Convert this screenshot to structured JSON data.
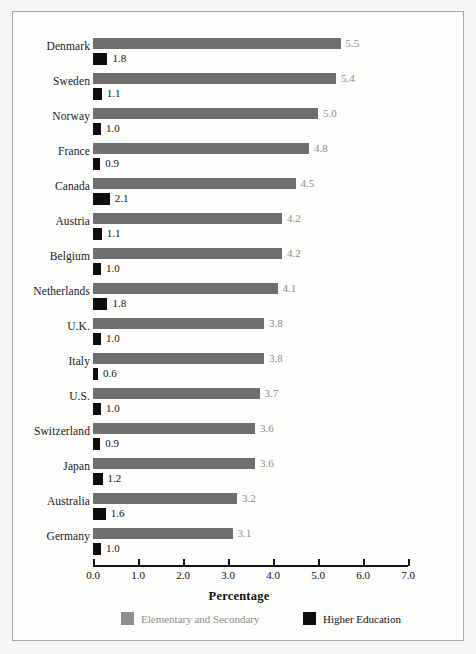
{
  "chart_data": {
    "type": "bar",
    "orientation": "horizontal",
    "title": "",
    "xlabel": "Percentage",
    "ylabel": "",
    "xlim": [
      0.0,
      7.0
    ],
    "xticks": [
      "0.0",
      "1.0",
      "2.0",
      "3.0",
      "4.0",
      "5.0",
      "6.0",
      "7.0"
    ],
    "grid": false,
    "legend_position": "bottom",
    "categories": [
      "Denmark",
      "Sweden",
      "Norway",
      "France",
      "Canada",
      "Austria",
      "Belgium",
      "Netherlands",
      "U.K.",
      "Italy",
      "U.S.",
      "Switzerland",
      "Japan",
      "Australia",
      "Germany"
    ],
    "series": [
      {
        "name": "Elementary and Secondary",
        "color": "#6f6f6f",
        "values": [
          5.5,
          5.4,
          5.0,
          4.8,
          4.5,
          4.2,
          4.2,
          4.1,
          3.8,
          3.8,
          3.7,
          3.6,
          3.6,
          3.2,
          3.1
        ],
        "labels": [
          "5.5",
          "5.4",
          "5.0",
          "4.8",
          "4.5",
          "4.2",
          "4.2",
          "4.1",
          "3.8",
          "3.8",
          "3.7",
          "3.6",
          "3.6",
          "3.2",
          "3.1"
        ]
      },
      {
        "name": "Higher Education",
        "color": "#0d0d0d",
        "values": [
          1.8,
          1.1,
          1.0,
          0.9,
          2.1,
          1.1,
          1.0,
          1.8,
          1.0,
          0.6,
          1.0,
          0.9,
          1.2,
          1.6,
          1.0
        ],
        "labels": [
          "1.8",
          "1.1",
          "1.0",
          "0.9",
          "2.1",
          "1.1",
          "1.0",
          "1.8",
          "1.0",
          "0.6",
          "1.0",
          "0.9",
          "1.2",
          "1.6",
          "1.0"
        ]
      }
    ]
  },
  "legend": {
    "items": [
      {
        "label": "Elementary and Secondary",
        "color": "#8f8f8f"
      },
      {
        "label": "Higher Education",
        "color": "#0d0d0d"
      }
    ]
  },
  "axis": {
    "label": "Percentage"
  }
}
